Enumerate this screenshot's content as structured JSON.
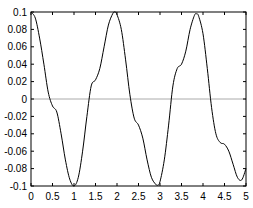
{
  "chart_data": {
    "type": "line",
    "title": "",
    "xlabel": "",
    "ylabel": "",
    "xlim": [
      0,
      5
    ],
    "ylim": [
      -0.1,
      0.1
    ],
    "grid": false,
    "zero_line": true,
    "x_ticks": [
      "0",
      "0.5",
      "1",
      "1.5",
      "2",
      "2.5",
      "3",
      "3.5",
      "4",
      "4.5",
      "5"
    ],
    "y_ticks": [
      "0.1",
      "0.08",
      "0.06",
      "0.04",
      "0.02",
      "0",
      "-0.02",
      "-0.04",
      "-0.06",
      "-0.08",
      "-0.1"
    ],
    "series": [
      {
        "name": "signal",
        "color": "#000000",
        "x": [
          0,
          0.1,
          0.2,
          0.3,
          0.4,
          0.5,
          0.6,
          0.7,
          0.8,
          0.9,
          1.0,
          1.1,
          1.2,
          1.3,
          1.4,
          1.5,
          1.6,
          1.7,
          1.8,
          1.9,
          1.95,
          2.0,
          2.1,
          2.2,
          2.3,
          2.4,
          2.5,
          2.6,
          2.7,
          2.8,
          2.9,
          2.95,
          3.0,
          3.1,
          3.2,
          3.3,
          3.4,
          3.5,
          3.6,
          3.7,
          3.8,
          3.85,
          3.9,
          4.0,
          4.1,
          4.2,
          4.3,
          4.4,
          4.5,
          4.6,
          4.7,
          4.8,
          4.9,
          5.0
        ],
        "y": [
          0.1,
          0.093,
          0.07,
          0.04,
          0.008,
          -0.008,
          -0.015,
          -0.04,
          -0.07,
          -0.092,
          -0.1,
          -0.09,
          -0.06,
          -0.02,
          0.015,
          0.022,
          0.035,
          0.06,
          0.085,
          0.098,
          0.1,
          0.097,
          0.08,
          0.045,
          0.005,
          -0.022,
          -0.03,
          -0.045,
          -0.07,
          -0.09,
          -0.098,
          -0.099,
          -0.095,
          -0.07,
          -0.03,
          0.015,
          0.035,
          0.04,
          0.055,
          0.08,
          0.096,
          0.098,
          0.095,
          0.075,
          0.035,
          -0.01,
          -0.04,
          -0.05,
          -0.052,
          -0.06,
          -0.075,
          -0.09,
          -0.093,
          -0.08
        ]
      }
    ]
  }
}
